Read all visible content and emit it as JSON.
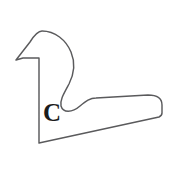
{
  "figure": {
    "title": "",
    "background_color": "#ffffff",
    "stroke_color": "#5a5a5c",
    "label_color": "#1c1c1c",
    "labels": [
      {
        "name": "region-label-c",
        "text": "C",
        "x": 43,
        "y": 100,
        "font_size": 25
      }
    ],
    "shape": {
      "name": "closed-outline-region",
      "description": "closed outlined region",
      "path": "M 16 60 L 30 42 C 35 34 38 31 42 31 C 55 31 66 40 71 52 C 76 64 74 74 69 84 C 63 95 60 100 61 106 C 63 113 72 113 80 106 C 86 101 90 98 96 98 L 148 95 C 158 95 162 99 162 105 L 162 113 C 162 115 161 116 159 117 L 39 143 L 39 58 L 23 58 Z",
      "vertices": [
        [
          16,
          60
        ],
        [
          30,
          42
        ],
        [
          42,
          31
        ],
        [
          71,
          52
        ],
        [
          69,
          84
        ],
        [
          61,
          106
        ],
        [
          80,
          106
        ],
        [
          96,
          98
        ],
        [
          148,
          95
        ],
        [
          162,
          105
        ],
        [
          162,
          113
        ],
        [
          159,
          117
        ],
        [
          39,
          143
        ],
        [
          39,
          58
        ],
        [
          23,
          58
        ]
      ]
    }
  }
}
